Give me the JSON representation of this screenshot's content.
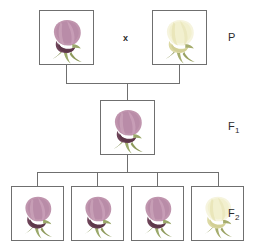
{
  "figure": {
    "background_color": "#ffffff",
    "border_color": "#6f6f6f",
    "text_color": "#2b2b2b"
  },
  "cross_symbol": "x",
  "generations": [
    {
      "id": "P",
      "label": "P",
      "label_main": "P",
      "label_sub": "",
      "individuals": [
        {
          "phenotype": "purple",
          "name": "purple-flower",
          "petal_color": "#b98ca8",
          "petal_shadow": "#6d4358",
          "sepal_color": "#8e9a5c"
        },
        {
          "phenotype": "white",
          "name": "white-flower",
          "petal_color": "#f2f0cf",
          "petal_shadow": "#dcd9a4",
          "sepal_color": "#9aa263"
        }
      ]
    },
    {
      "id": "F1",
      "label": "F1",
      "label_main": "F",
      "label_sub": "1",
      "individuals": [
        {
          "phenotype": "purple",
          "name": "purple-flower",
          "petal_color": "#b98ca8",
          "petal_shadow": "#6d4358",
          "sepal_color": "#8e9a5c"
        }
      ]
    },
    {
      "id": "F2",
      "label": "F2",
      "label_main": "F",
      "label_sub": "2",
      "individuals": [
        {
          "phenotype": "purple",
          "name": "purple-flower",
          "petal_color": "#b98ca8",
          "petal_shadow": "#6d4358",
          "sepal_color": "#8e9a5c"
        },
        {
          "phenotype": "purple",
          "name": "purple-flower",
          "petal_color": "#b98ca8",
          "petal_shadow": "#6d4358",
          "sepal_color": "#8e9a5c"
        },
        {
          "phenotype": "purple",
          "name": "purple-flower",
          "petal_color": "#b98ca8",
          "petal_shadow": "#6d4358",
          "sepal_color": "#8e9a5c"
        },
        {
          "phenotype": "white",
          "name": "white-flower",
          "petal_color": "#f2f0cf",
          "petal_shadow": "#dcd9a4",
          "sepal_color": "#9aa263"
        }
      ]
    }
  ]
}
